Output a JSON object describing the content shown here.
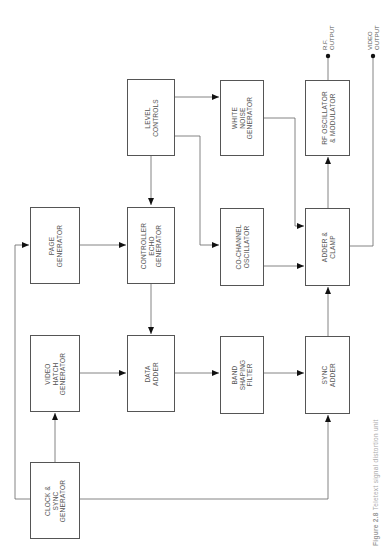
{
  "figure": {
    "caption_number": "Figure 2.8",
    "caption_text": "Teletext signal distortion unit"
  },
  "blocks": {
    "clock_sync": "CLOCK &\nSYNC\nGENERATOR",
    "video_hatch": "VIDEO\nHATCH\nGENERATOR",
    "page_gen": "PAGE\nGENERATOR",
    "data_adder": "DATA\nADDER",
    "controller_echo": "CONTROLLER\nECHO\nGENERATOR",
    "level_controls": "LEVEL\nCONTROLS",
    "band_filter": "BAND\nSHAPING\nFILTER",
    "cochannel": "CO-CHANNEL\nOSCILLATOR",
    "white_noise": "WHITE\nNOISE\nGENERATOR",
    "sync_adder": "SYNC\nADDER",
    "adder_clamp": "ADDER &\nCLAMP",
    "rf_osc": "RF OSCILLATOR\n& MODULATOR"
  },
  "outputs": {
    "rf": "R.F.\nOUTPUT",
    "video": "VIDEO\nOUTPUT"
  },
  "connections": [
    {
      "from": "clock_sync",
      "to": "video_hatch"
    },
    {
      "from": "clock_sync",
      "to": "page_gen"
    },
    {
      "from": "clock_sync",
      "to": "sync_adder"
    },
    {
      "from": "video_hatch",
      "to": "data_adder"
    },
    {
      "from": "page_gen",
      "to": "controller_echo"
    },
    {
      "from": "level_controls",
      "to": "controller_echo"
    },
    {
      "from": "level_controls",
      "to": "white_noise"
    },
    {
      "from": "level_controls",
      "to": "cochannel"
    },
    {
      "from": "controller_echo",
      "to": "data_adder"
    },
    {
      "from": "data_adder",
      "to": "band_filter"
    },
    {
      "from": "band_filter",
      "to": "sync_adder"
    },
    {
      "from": "sync_adder",
      "to": "adder_clamp"
    },
    {
      "from": "cochannel",
      "to": "adder_clamp"
    },
    {
      "from": "white_noise",
      "to": "adder_clamp"
    },
    {
      "from": "adder_clamp",
      "to": "rf_osc"
    },
    {
      "from": "rf_osc",
      "to": "rf_output"
    },
    {
      "from": "adder_clamp",
      "to": "video_output"
    }
  ],
  "colors": {
    "line": "#666666",
    "box_border": "#555555",
    "text": "#555555",
    "arrow": "#111111"
  }
}
